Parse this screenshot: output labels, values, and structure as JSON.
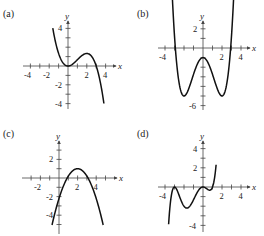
{
  "panels": [
    {
      "label": "(a)",
      "x_axis": "x",
      "y_axis": "y",
      "x_ticks": [
        "-4",
        "-2",
        "2",
        "4"
      ],
      "y_ticks": [
        "4",
        "-2",
        "-4"
      ]
    },
    {
      "label": "(b)",
      "x_axis": "x",
      "y_axis": "y",
      "x_ticks": [
        "-4",
        "2",
        "4"
      ],
      "y_ticks": [
        "2",
        "-6"
      ]
    },
    {
      "label": "(c)",
      "x_axis": "x",
      "y_axis": "y",
      "x_ticks": [
        "-2",
        "2",
        "4"
      ],
      "y_ticks": [
        "2",
        "-2",
        "-4"
      ]
    },
    {
      "label": "(d)",
      "x_axis": "x",
      "y_axis": "y",
      "x_ticks": [
        "-4",
        "2",
        "4"
      ],
      "y_ticks": [
        "4",
        "2",
        "-4"
      ]
    }
  ],
  "chart_data": [
    {
      "type": "line",
      "title": "(a)",
      "xlabel": "x",
      "ylabel": "y",
      "xlim": [
        -4.5,
        4.5
      ],
      "ylim": [
        -4.5,
        4.5
      ],
      "description": "cubic, local min (0,0), local max (2,1.33), falling right",
      "x": [
        -1.6,
        -1,
        0,
        1,
        2,
        3,
        3.8
      ],
      "y": [
        4.5,
        1.33,
        0,
        0.67,
        1.33,
        0,
        -4.4
      ]
    },
    {
      "type": "line",
      "title": "(b)",
      "xlabel": "x",
      "ylabel": "y",
      "xlim": [
        -4.5,
        4.5
      ],
      "ylim": [
        -6.5,
        3
      ],
      "description": "quartic, minima (-2,-5) and (2,-5), local max (0,-1)",
      "x": [
        -3.3,
        -3,
        -2,
        -1,
        0,
        1,
        2,
        3,
        3.3
      ],
      "y": [
        2.6,
        1.25,
        -5,
        -2.75,
        -1,
        -2.75,
        -5,
        1.25,
        2.6
      ]
    },
    {
      "type": "line",
      "title": "(c)",
      "xlabel": "x",
      "ylabel": "y",
      "xlim": [
        -3,
        5.5
      ],
      "ylim": [
        -5.5,
        3.5
      ],
      "description": "downward parabola, vertex (2,1)",
      "x": [
        -0.8,
        0,
        1,
        2,
        3,
        4,
        4.8
      ],
      "y": [
        -5.3,
        -2.2,
        0.2,
        1,
        0.2,
        -2.2,
        -5.3
      ]
    },
    {
      "type": "line",
      "title": "(d)",
      "xlabel": "x",
      "ylabel": "y",
      "xlim": [
        -4.5,
        4.5
      ],
      "ylim": [
        -4.5,
        4.5
      ],
      "description": "quintic, touches 0 at x=-3 and x=0, min (-2,-2), min (~0.7,-0.3)",
      "x": [
        -3.6,
        -3,
        -2,
        -1,
        0,
        0.7,
        1,
        1.3
      ],
      "y": [
        -4.4,
        0,
        -2,
        -1.33,
        0,
        -0.35,
        0,
        4.5
      ]
    }
  ]
}
